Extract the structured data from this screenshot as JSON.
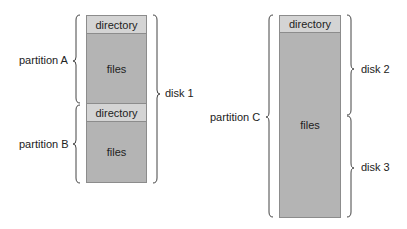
{
  "left_stack": {
    "partitions": [
      {
        "name": "partition A",
        "directory": "directory",
        "files": "files"
      },
      {
        "name": "partition B",
        "directory": "directory",
        "files": "files"
      }
    ],
    "disk": "disk 1"
  },
  "right_stack": {
    "partition": {
      "name": "partition C",
      "directory": "directory",
      "files": "files"
    },
    "disks": [
      "disk 2",
      "disk 3"
    ]
  },
  "colors": {
    "directory": "#d4d4d4",
    "files": "#b4b4b4",
    "border": "#8c8c8c"
  }
}
